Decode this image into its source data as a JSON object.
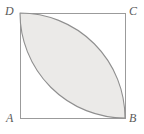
{
  "figure": {
    "name": "square-with-lens-region",
    "background_color": "#ffffff",
    "square": {
      "stroke_color": "#9b9b9b",
      "stroke_width": 1,
      "fill_color": "#ffffff",
      "x": 20,
      "y": 13,
      "size": 105
    },
    "shaded_region": {
      "description": "lens (vesica) formed by two quarter-circle arcs between D and B",
      "fill_color": "#ebeae8",
      "stroke_color": "#8f8f8f",
      "stroke_width": 1.1,
      "arc_radius": 105,
      "arc1_center_label": "A",
      "arc2_center_label": "C"
    },
    "labels": {
      "A": "A",
      "B": "B",
      "C": "C",
      "D": "D"
    },
    "label_color": "#5a5a5a"
  }
}
